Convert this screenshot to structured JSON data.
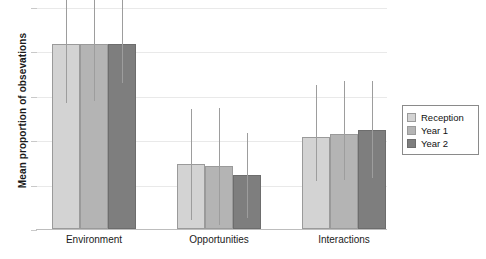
{
  "chart_data": {
    "type": "bar",
    "title": "",
    "subtitle": "",
    "xlabel": "",
    "ylabel": "Mean proportion of obsevations",
    "categories": [
      "Environment",
      "Opportunities",
      "Interactions"
    ],
    "series": [
      {
        "name": "Reception",
        "color": "#d3d3d3",
        "values": [
          0.5,
          0.175,
          0.25
        ],
        "errors_upper": [
          0.215,
          0.15,
          0.14
        ],
        "errors_lower": [
          0.16,
          0.15,
          0.12
        ]
      },
      {
        "name": "Year 1",
        "color": "#b4b4b4",
        "values": [
          0.5,
          0.17,
          0.257
        ],
        "errors_upper": [
          0.165,
          0.158,
          0.143
        ],
        "errors_lower": [
          0.155,
          0.158,
          0.125
        ]
      },
      {
        "name": "Year 2",
        "color": "#7e7e7e",
        "values": [
          0.5,
          0.145,
          0.268
        ],
        "errors_upper": [
          0.118,
          0.115,
          0.132
        ],
        "errors_lower": [
          0.105,
          0.115,
          0.13
        ]
      }
    ],
    "ylim": [
      0.0,
      0.6
    ],
    "yticks": [
      0.0,
      0.12,
      0.24,
      0.36,
      0.48,
      0.6
    ],
    "ytick_labels": [
      "",
      "",
      "",
      "",
      "",
      ""
    ],
    "grid": true,
    "legend_position": "right",
    "error_bar_style": "line-no-caps",
    "background": "#ffffff",
    "axis_color": "#bdbdbd",
    "grid_color": "#e9e9e9",
    "error_bar_color": "#9d9d9d"
  },
  "legend": {
    "items": [
      {
        "label": "Reception"
      },
      {
        "label": "Year 1"
      },
      {
        "label": "Year 2"
      }
    ]
  }
}
